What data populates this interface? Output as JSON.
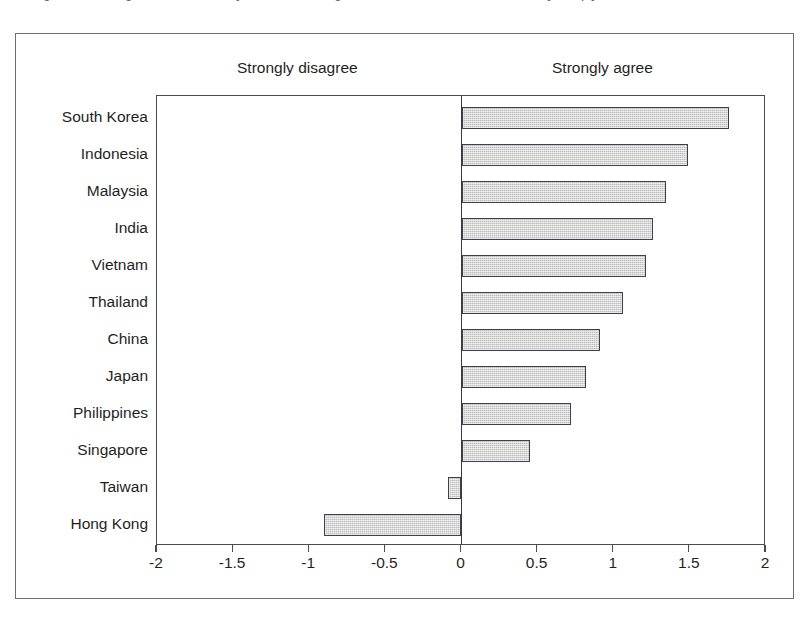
{
  "caption": {
    "text": "The government regulates the economy and enforces regulations so that business and industry comply."
  },
  "chart_data": {
    "type": "bar",
    "orientation": "horizontal",
    "title": "",
    "xlabel": "",
    "ylabel": "",
    "xlim": [
      -2,
      2
    ],
    "xticks": [
      -2,
      -1.5,
      -1,
      -0.5,
      0,
      0.5,
      1,
      1.5,
      2
    ],
    "xtick_labels": [
      "-2",
      "-1.5",
      "-1",
      "-0.5",
      "0",
      "0.5",
      "1",
      "1.5",
      "2"
    ],
    "grid": false,
    "legend": null,
    "annotations": {
      "left_pole": "Strongly disagree",
      "right_pole": "Strongly agree"
    },
    "bar_color": "#d2d2d2",
    "bar_edge_color": "#40404a",
    "categories": [
      "South Korea",
      "Indonesia",
      "Malaysia",
      "India",
      "Vietnam",
      "Thailand",
      "China",
      "Japan",
      "Philippines",
      "Singapore",
      "Taiwan",
      "Hong Kong"
    ],
    "values": [
      1.76,
      1.49,
      1.34,
      1.26,
      1.21,
      1.06,
      0.91,
      0.82,
      0.72,
      0.45,
      -0.09,
      -0.9
    ]
  }
}
